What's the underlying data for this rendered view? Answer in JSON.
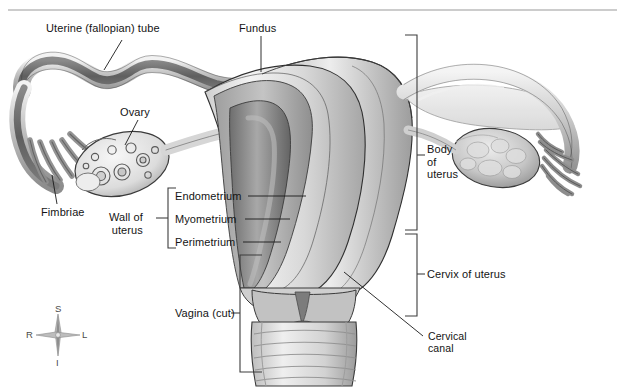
{
  "page": {
    "width": 625,
    "height": 389,
    "background_color": "#ffffff",
    "header_rule_color": "#9a9a9a"
  },
  "figure": {
    "style": "grayscale medical illustration",
    "palette": {
      "outline": "#2b2b2b",
      "leader_line": "#1a1a1a",
      "bracket": "#3c3c3c",
      "tissue_light": "#e6e6e6",
      "tissue_mid": "#b9b9b9",
      "tissue_dark": "#7a7a7a",
      "cavity_dark": "#5e5e5e",
      "highlight": "#f5f5f5"
    }
  },
  "labels": [
    {
      "id": "uterine-tube",
      "text": "Uterine (fallopian) tube",
      "x": 46,
      "y": 22,
      "leader": {
        "x1": 122,
        "y1": 40,
        "x2": 104,
        "y2": 70
      }
    },
    {
      "id": "fundus",
      "text": "Fundus",
      "x": 239,
      "y": 22,
      "leader": {
        "x1": 261,
        "y1": 36,
        "x2": 261,
        "y2": 72
      }
    },
    {
      "id": "ovary",
      "text": "Ovary",
      "x": 120,
      "y": 106,
      "leader": {
        "x1": 138,
        "y1": 120,
        "x2": 125,
        "y2": 145
      }
    },
    {
      "id": "fimbriae",
      "text": "Fimbriae",
      "x": 41,
      "y": 206,
      "leader": {
        "x1": 57,
        "y1": 204,
        "x2": 52,
        "y2": 175
      }
    },
    {
      "id": "endometrium",
      "text": "Endometrium",
      "x": 175,
      "y": 190,
      "leader": {
        "x1": 248,
        "y1": 196,
        "x2": 306,
        "y2": 196
      }
    },
    {
      "id": "myometrium",
      "text": "Myometrium",
      "x": 175,
      "y": 213,
      "leader": {
        "x1": 245,
        "y1": 219,
        "x2": 290,
        "y2": 219
      }
    },
    {
      "id": "perimetrium",
      "text": "Perimetrium",
      "x": 175,
      "y": 236,
      "leader": {
        "x1": 243,
        "y1": 242,
        "x2": 281,
        "y2": 242
      }
    },
    {
      "id": "wall-of-uterus",
      "text": "Wall of\nuterus",
      "x": 113,
      "y": 211,
      "leader": {
        "x1": 156,
        "y1": 218,
        "x2": 168,
        "y2": 218
      }
    },
    {
      "id": "vagina-cut",
      "text": "Vagina (cut)",
      "x": 175,
      "y": 307,
      "leader": {
        "x1": 231,
        "y1": 313,
        "x2": 240,
        "y2": 313
      }
    },
    {
      "id": "body-of-uterus",
      "text": "Body\nof\nuterus",
      "x": 427,
      "y": 143,
      "leader": {
        "x1": 417,
        "y1": 155,
        "x2": 425,
        "y2": 155
      }
    },
    {
      "id": "cervix-of-uterus",
      "text": "Cervix of uterus",
      "x": 427,
      "y": 268,
      "leader": {
        "x1": 417,
        "y1": 274,
        "x2": 425,
        "y2": 274
      }
    },
    {
      "id": "cervical-canal",
      "text": "Cervical\ncanal",
      "x": 428,
      "y": 330,
      "leader": {
        "x1": 423,
        "y1": 336,
        "x2": 344,
        "y2": 272
      }
    }
  ],
  "brackets": [
    {
      "id": "wall-of-uterus-bracket",
      "side": "right-facing",
      "x": 168,
      "y_top": 188,
      "y_bottom": 248,
      "arm": 8
    },
    {
      "id": "vagina-bracket",
      "side": "right-facing",
      "x": 240,
      "y_top": 255,
      "y_bottom": 372,
      "arm": 22
    },
    {
      "id": "body-of-uterus-bracket",
      "side": "left-facing",
      "x": 417,
      "y_top": 35,
      "y_bottom": 230,
      "arm": 12
    },
    {
      "id": "cervix-bracket",
      "side": "left-facing",
      "x": 417,
      "y_top": 234,
      "y_bottom": 316,
      "arm": 12
    }
  ],
  "compass": {
    "id": "orientation-compass",
    "center_x": 58,
    "center_y": 335,
    "superior": "S",
    "inferior": "I",
    "right": "R",
    "left": "L"
  }
}
